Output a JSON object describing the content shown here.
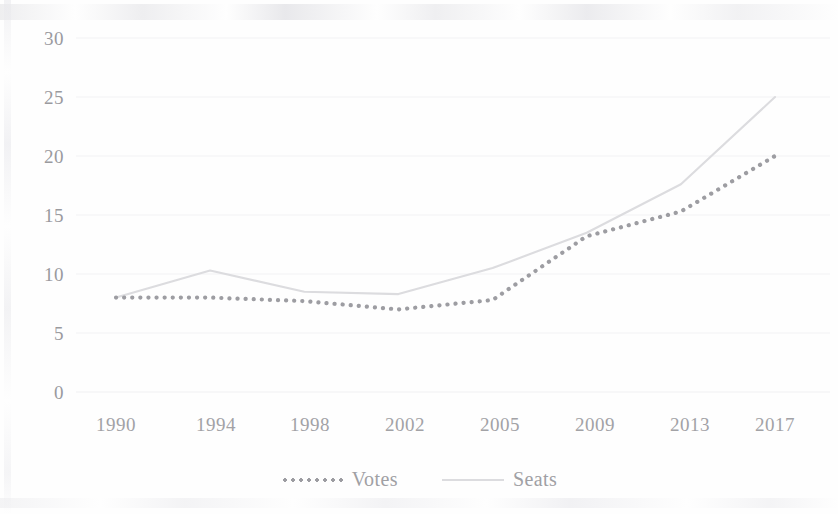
{
  "chart_data": {
    "type": "line",
    "title": "",
    "subtitle": "",
    "xlabel": "",
    "ylabel": "",
    "categories": [
      "1990",
      "1994",
      "1998",
      "2002",
      "2005",
      "2009",
      "2013",
      "2017"
    ],
    "x": [
      1990,
      1994,
      1998,
      2002,
      2005,
      2009,
      2013,
      2017
    ],
    "series": [
      {
        "name": "Votes",
        "values": [
          8.0,
          8.0,
          7.7,
          7.0,
          7.8,
          13.2,
          15.3,
          20.0
        ],
        "style": "dotted",
        "color": "#9d9da2"
      },
      {
        "name": "Seats",
        "values": [
          8.0,
          10.3,
          8.5,
          8.3,
          10.5,
          13.5,
          17.6,
          25.0
        ],
        "style": "solid",
        "color": "#dcdcdf"
      }
    ],
    "ylim": [
      0,
      30
    ],
    "yticks": [
      0,
      5,
      10,
      15,
      20,
      25,
      30
    ],
    "ytick_labels": [
      "0",
      "5",
      "10",
      "15",
      "20",
      "25",
      "30"
    ],
    "grid": true,
    "grid_color": "#f0f0f2",
    "legend_position": "bottom",
    "background": "#fefefe"
  },
  "axis": {
    "y_labels": [
      "30",
      "25",
      "20",
      "15",
      "10",
      "5",
      "0"
    ],
    "x_labels": [
      "1990",
      "1994",
      "1998",
      "2002",
      "2005",
      "2009",
      "2013",
      "2017"
    ]
  },
  "legend": {
    "items": [
      {
        "label": "Votes",
        "style": "dotted"
      },
      {
        "label": "Seats",
        "style": "solid"
      }
    ]
  }
}
